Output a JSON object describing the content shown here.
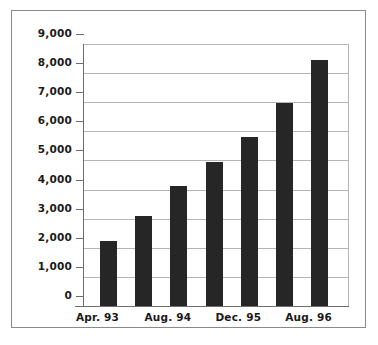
{
  "chart_data": {
    "type": "bar",
    "title": "",
    "subtitle": "",
    "xlabel": "",
    "ylabel": "",
    "categories": [
      "Apr. 93",
      "",
      "Aug. 94",
      "",
      "Dec. 95",
      "",
      "Aug. 96"
    ],
    "values": [
      2250,
      3100,
      4120,
      4960,
      5820,
      6990,
      8450
    ],
    "ylim": [
      0,
      9000
    ],
    "ytick_labels": [
      "0",
      "1,000",
      "2,000",
      "3,000",
      "4,000",
      "5,000",
      "6,000",
      "7,000",
      "8,000",
      "9,000"
    ],
    "ytick_values": [
      0,
      1000,
      2000,
      3000,
      4000,
      5000,
      6000,
      7000,
      8000,
      9000
    ],
    "xtick_labels": [
      "Apr. 93",
      "Aug. 94",
      "Dec. 95",
      "Aug. 96"
    ],
    "xtick_bar_index": [
      0,
      2,
      4,
      6
    ],
    "grid": true,
    "legend": false,
    "legend_position": "none",
    "bar_color": "#262626",
    "grid_color": "#b4b4b4",
    "axis_color": "#6e6e6e",
    "frame_color": "#8a8a8a",
    "background_color": "#ffffff",
    "text_color": "#1a1a1a"
  }
}
